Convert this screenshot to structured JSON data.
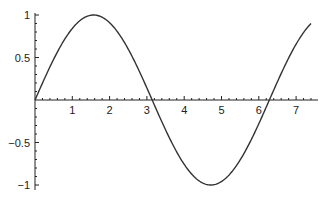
{
  "chart_data": {
    "type": "line",
    "title": "",
    "xlabel": "",
    "ylabel": "",
    "function": "sin(x)",
    "xlim": [
      0,
      7.4
    ],
    "ylim": [
      -1,
      1
    ],
    "grid": false,
    "legend": null,
    "x_ticks": [
      {
        "value": 1,
        "label": "1"
      },
      {
        "value": 2,
        "label": "2"
      },
      {
        "value": 3,
        "label": "3"
      },
      {
        "value": 4,
        "label": "4"
      },
      {
        "value": 5,
        "label": "5"
      },
      {
        "value": 6,
        "label": "6"
      },
      {
        "value": 7,
        "label": "7"
      }
    ],
    "y_ticks": [
      {
        "value": 1,
        "label": "1"
      },
      {
        "value": 0.5,
        "label": "0.5"
      },
      {
        "value": -0.5,
        "label": "−0.5"
      },
      {
        "value": -1,
        "label": "−1"
      }
    ],
    "series": [
      {
        "name": "sin(x)",
        "color": "#333333",
        "x": [
          0,
          0.5,
          1,
          1.5708,
          2,
          2.5,
          3,
          3.1416,
          3.5,
          4,
          4.5,
          4.7124,
          5,
          5.5,
          6,
          6.2832,
          6.5,
          7,
          7.4
        ],
        "y": [
          0,
          0.479,
          0.841,
          1,
          0.909,
          0.598,
          0.141,
          0,
          -0.351,
          -0.757,
          -0.978,
          -1,
          -0.959,
          -0.706,
          -0.279,
          0,
          0.215,
          0.657,
          0.899
        ]
      }
    ]
  }
}
